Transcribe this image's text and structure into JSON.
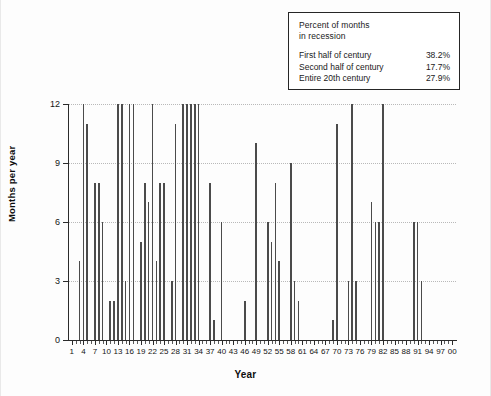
{
  "note_box": {
    "title_line1": "Percent of months",
    "title_line2": "in recession",
    "rows": [
      {
        "label": "First half of century",
        "value": "38.2%"
      },
      {
        "label": "Second half of century",
        "value": "17.7%"
      },
      {
        "label": "Entire 20th century",
        "value": "27.9%"
      }
    ]
  },
  "axes": {
    "ylabel": "Months per year",
    "xlabel": "Year",
    "y_ticks": [
      "0",
      "3",
      "6",
      "9",
      "12"
    ],
    "x_ticks": [
      "1",
      "4",
      "7",
      "10",
      "13",
      "16",
      "19",
      "22",
      "25",
      "28",
      "31",
      "34",
      "37",
      "40",
      "43",
      "46",
      "49",
      "52",
      "55",
      "58",
      "61",
      "64",
      "67",
      "70",
      "73",
      "76",
      "79",
      "82",
      "85",
      "88",
      "91",
      "94",
      "97",
      "00"
    ]
  },
  "colors": {
    "bar": "#4b4b4b",
    "axis": "#2b2b2b",
    "grid": "#b9b9b9",
    "text": "#151515",
    "background": "#fdfdfd",
    "note_border": "#262626"
  },
  "chart_data": {
    "type": "bar",
    "title": "",
    "xlabel": "Year",
    "ylabel": "Months per year",
    "ylim": [
      0,
      12
    ],
    "y_ticks": [
      0,
      3,
      6,
      9,
      12
    ],
    "grid": true,
    "legend": false,
    "x_tick_step": 3,
    "x_tick_start": 1,
    "note": "Year labels are two-digit years of the 20th century: 1 = 1901 ... 00 = 2000",
    "categories": [
      1,
      2,
      3,
      4,
      5,
      6,
      7,
      8,
      9,
      10,
      11,
      12,
      13,
      14,
      15,
      16,
      17,
      18,
      19,
      20,
      21,
      22,
      23,
      24,
      25,
      26,
      27,
      28,
      29,
      30,
      31,
      32,
      33,
      34,
      35,
      36,
      37,
      38,
      39,
      40,
      41,
      42,
      43,
      44,
      45,
      46,
      47,
      48,
      49,
      50,
      51,
      52,
      53,
      54,
      55,
      56,
      57,
      58,
      59,
      60,
      61,
      62,
      63,
      64,
      65,
      66,
      67,
      68,
      69,
      70,
      71,
      72,
      73,
      74,
      75,
      76,
      77,
      78,
      79,
      80,
      81,
      82,
      83,
      84,
      85,
      86,
      87,
      88,
      89,
      90,
      91,
      92,
      93,
      94,
      95,
      96,
      97,
      98,
      99,
      100
    ],
    "values": [
      0,
      0,
      4,
      12,
      11,
      0,
      8,
      8,
      6,
      0,
      2,
      2,
      12,
      12,
      3,
      12,
      12,
      0,
      5,
      8,
      7,
      12,
      4,
      8,
      8,
      0,
      3,
      11,
      0,
      12,
      12,
      12,
      12,
      12,
      0,
      0,
      8,
      1,
      0,
      6,
      0,
      0,
      0,
      0,
      0,
      2,
      0,
      0,
      10,
      0,
      0,
      6,
      5,
      8,
      4,
      0,
      0,
      9,
      3,
      2,
      0,
      0,
      0,
      0,
      0,
      0,
      0,
      0,
      1,
      11,
      0,
      0,
      3,
      12,
      3,
      0,
      0,
      0,
      7,
      6,
      6,
      12,
      0,
      0,
      0,
      0,
      0,
      0,
      0,
      6,
      6,
      3,
      0,
      0,
      0,
      0,
      0,
      0,
      0,
      0
    ]
  }
}
